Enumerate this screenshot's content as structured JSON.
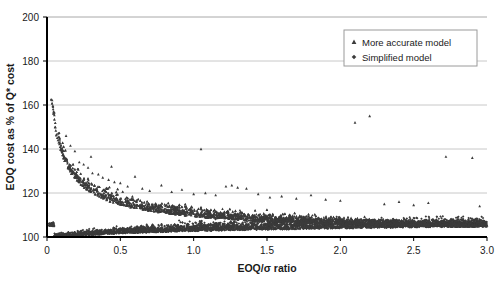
{
  "chart_data": {
    "type": "scatter",
    "title": "",
    "xlabel": "EOQ/σ ratio",
    "ylabel": "EOQ cost as % of Q* cost",
    "xlim": [
      0,
      3.0
    ],
    "ylim": [
      100,
      200
    ],
    "xticks": [
      "0",
      "0.5",
      "1.0",
      "1.5",
      "2.0",
      "2.5",
      "3.0"
    ],
    "xtick_values": [
      0,
      0.5,
      1.0,
      1.5,
      2.0,
      2.5,
      3.0
    ],
    "yticks": [
      "100",
      "120",
      "140",
      "160",
      "180",
      "200"
    ],
    "ytick_values": [
      100,
      120,
      140,
      160,
      180,
      200
    ],
    "grid": true,
    "grid_axis": "y",
    "grid_color": "#c8c8c8",
    "marker_color": "#3b3b3b",
    "legend_position": "top-right",
    "legend": [
      {
        "name": "More accurate model",
        "marker": "triangle"
      },
      {
        "name": "Simplified model",
        "marker": "diamond"
      }
    ],
    "series": [
      {
        "name": "More accurate model",
        "marker": "triangle",
        "description": "Upper decaying cloud: starts near 162% at very small EOQ/sigma and decays toward ~105% as the ratio grows; sparse high outliers near 2.1 and 2.8.",
        "points": [
          [
            0.035,
            162.2
          ],
          [
            0.04,
            159.6
          ],
          [
            0.042,
            158.1
          ],
          [
            0.045,
            157.0
          ],
          [
            0.047,
            156.2
          ],
          [
            0.05,
            155.4
          ],
          [
            0.055,
            150.0
          ],
          [
            0.06,
            148.4
          ],
          [
            0.065,
            146.6
          ],
          [
            0.07,
            145.1
          ],
          [
            0.075,
            144.0
          ],
          [
            0.08,
            143.0
          ],
          [
            0.085,
            142.2
          ],
          [
            0.09,
            141.0
          ],
          [
            0.095,
            140.2
          ],
          [
            0.1,
            139.3
          ],
          [
            0.105,
            138.4
          ],
          [
            0.11,
            137.6
          ],
          [
            0.115,
            136.9
          ],
          [
            0.12,
            136.1
          ],
          [
            0.125,
            135.4
          ],
          [
            0.13,
            134.7
          ],
          [
            0.14,
            133.5
          ],
          [
            0.15,
            132.3
          ],
          [
            0.16,
            131.2
          ],
          [
            0.17,
            130.2
          ],
          [
            0.18,
            129.3
          ],
          [
            0.19,
            128.5
          ],
          [
            0.2,
            127.7
          ],
          [
            0.21,
            127.0
          ],
          [
            0.22,
            126.3
          ],
          [
            0.23,
            125.7
          ],
          [
            0.24,
            125.1
          ],
          [
            0.25,
            124.5
          ],
          [
            0.26,
            124.0
          ],
          [
            0.27,
            123.5
          ],
          [
            0.28,
            123.0
          ],
          [
            0.29,
            122.6
          ],
          [
            0.3,
            122.1
          ],
          [
            0.32,
            121.3
          ],
          [
            0.34,
            120.6
          ],
          [
            0.36,
            119.9
          ],
          [
            0.38,
            119.3
          ],
          [
            0.4,
            118.7
          ],
          [
            0.42,
            118.2
          ],
          [
            0.44,
            117.7
          ],
          [
            0.46,
            117.2
          ],
          [
            0.48,
            116.8
          ],
          [
            0.5,
            116.4
          ],
          [
            0.55,
            115.5
          ],
          [
            0.6,
            114.7
          ],
          [
            0.65,
            114.0
          ],
          [
            0.7,
            113.4
          ],
          [
            0.75,
            112.9
          ],
          [
            0.8,
            112.4
          ],
          [
            0.85,
            111.9
          ],
          [
            0.9,
            111.5
          ],
          [
            0.95,
            111.1
          ],
          [
            1.0,
            110.8
          ],
          [
            1.1,
            110.1
          ],
          [
            1.2,
            109.6
          ],
          [
            1.3,
            109.1
          ],
          [
            1.4,
            108.7
          ],
          [
            1.5,
            108.3
          ],
          [
            1.6,
            108.0
          ],
          [
            1.7,
            107.7
          ],
          [
            1.8,
            107.4
          ],
          [
            1.9,
            107.2
          ],
          [
            2.0,
            106.9
          ],
          [
            2.1,
            106.7
          ],
          [
            2.2,
            106.5
          ],
          [
            2.3,
            106.3
          ],
          [
            2.4,
            106.1
          ],
          [
            2.5,
            106.0
          ],
          [
            2.6,
            105.8
          ],
          [
            2.7,
            105.7
          ],
          [
            2.8,
            105.5
          ],
          [
            2.9,
            105.4
          ],
          [
            3.0,
            105.3
          ],
          [
            0.13,
            146.0
          ],
          [
            0.16,
            141.5
          ],
          [
            0.19,
            139.0
          ],
          [
            0.22,
            134.0
          ],
          [
            0.25,
            133.0
          ],
          [
            0.28,
            131.5
          ],
          [
            0.31,
            129.0
          ],
          [
            0.35,
            128.5
          ],
          [
            0.38,
            127.0
          ],
          [
            0.42,
            126.0
          ],
          [
            0.46,
            125.0
          ],
          [
            0.5,
            124.5
          ],
          [
            0.55,
            123.0
          ],
          [
            0.6,
            127.5
          ],
          [
            0.65,
            122.0
          ],
          [
            0.7,
            121.0
          ],
          [
            0.78,
            123.5
          ],
          [
            0.85,
            120.5
          ],
          [
            0.92,
            121.5
          ],
          [
            1.0,
            119.5
          ],
          [
            1.08,
            120.0
          ],
          [
            1.15,
            119.0
          ],
          [
            1.22,
            123.0
          ],
          [
            1.26,
            123.5
          ],
          [
            1.3,
            122.5
          ],
          [
            1.36,
            122.0
          ],
          [
            1.44,
            119.5
          ],
          [
            1.52,
            118.0
          ],
          [
            1.6,
            118.5
          ],
          [
            1.7,
            117.5
          ],
          [
            1.8,
            119.0
          ],
          [
            1.9,
            117.0
          ],
          [
            2.0,
            116.5
          ],
          [
            2.1,
            152.0
          ],
          [
            2.2,
            155.0
          ],
          [
            2.3,
            115.0
          ],
          [
            2.4,
            116.0
          ],
          [
            2.5,
            114.5
          ],
          [
            2.6,
            115.5
          ],
          [
            2.72,
            136.5
          ],
          [
            2.9,
            136.0
          ],
          [
            2.95,
            114.0
          ],
          [
            1.05,
            140.0
          ],
          [
            0.44,
            132.0
          ],
          [
            0.3,
            136.5
          ]
        ]
      },
      {
        "name": "Simplified model",
        "marker": "diamond",
        "description": "Dense band hugging the 100% floor across the full ratio range, thickening slightly and rising to roughly 104-107% at larger ratios.",
        "points": [
          [
            0.05,
            100.4
          ],
          [
            0.1,
            100.6
          ],
          [
            0.15,
            100.8
          ],
          [
            0.2,
            101.0
          ],
          [
            0.25,
            101.2
          ],
          [
            0.3,
            101.4
          ],
          [
            0.35,
            101.6
          ],
          [
            0.4,
            101.8
          ],
          [
            0.45,
            102.0
          ],
          [
            0.5,
            102.1
          ],
          [
            0.6,
            102.4
          ],
          [
            0.7,
            102.6
          ],
          [
            0.8,
            102.8
          ],
          [
            0.9,
            103.0
          ],
          [
            1.0,
            103.2
          ],
          [
            1.1,
            103.3
          ],
          [
            1.2,
            103.5
          ],
          [
            1.3,
            103.6
          ],
          [
            1.4,
            103.8
          ],
          [
            1.5,
            103.9
          ],
          [
            1.6,
            104.0
          ],
          [
            1.7,
            104.1
          ],
          [
            1.8,
            104.2
          ],
          [
            1.9,
            104.3
          ],
          [
            2.0,
            104.4
          ],
          [
            2.1,
            104.5
          ],
          [
            2.2,
            104.6
          ],
          [
            2.3,
            104.7
          ],
          [
            2.4,
            104.8
          ],
          [
            2.5,
            104.9
          ],
          [
            2.6,
            105.0
          ],
          [
            2.7,
            105.1
          ],
          [
            2.8,
            105.2
          ],
          [
            2.9,
            105.3
          ],
          [
            3.0,
            105.4
          ]
        ]
      }
    ]
  }
}
